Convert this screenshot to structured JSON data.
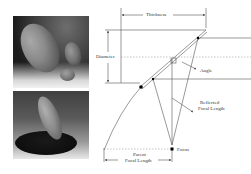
{
  "figure": {
    "photos": [
      {
        "name": "three-ellipsoid-mirrors",
        "description": "Three elliptical off-axis mirrors of varying size on dark backdrop"
      },
      {
        "name": "ellipsoid-mirror-on-base",
        "description": "Elongated elliptical mirror on dark cylindrical base"
      }
    ],
    "diagram": {
      "labels": {
        "thickness": "Thickness",
        "diameter": "Diameter",
        "angle": "Angle",
        "reflected_focal_length_line1": "Reflected",
        "reflected_focal_length_line2": "Focal Length",
        "focus": "Focus",
        "parent_focal_length_line1": "Parent",
        "parent_focal_length_line2": "Focal Length"
      },
      "colors": {
        "line": "#555555",
        "dashed": "#888888",
        "point": "#000000"
      }
    }
  }
}
